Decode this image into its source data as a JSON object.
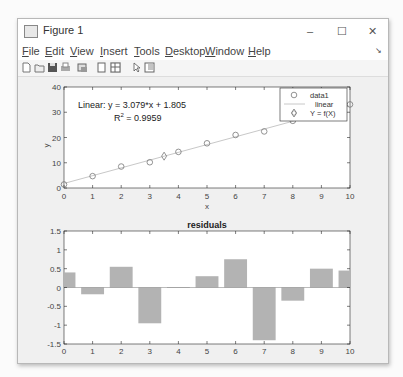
{
  "window": {
    "title": "Figure 1",
    "controls": {
      "minimize": "–",
      "maximize": "☐",
      "close": "✕"
    }
  },
  "menubar": {
    "items": [
      {
        "label": "File",
        "accel": "F"
      },
      {
        "label": "Edit",
        "accel": "E"
      },
      {
        "label": "View",
        "accel": "V"
      },
      {
        "label": "Insert",
        "accel": "I"
      },
      {
        "label": "Tools",
        "accel": "T"
      },
      {
        "label": "Desktop",
        "accel": "D"
      },
      {
        "label": "Window",
        "accel": "W"
      },
      {
        "label": "Help",
        "accel": "H"
      }
    ],
    "dock_icon": "↘"
  },
  "toolbar": {
    "icons": [
      "new-figure-icon",
      "open-file-icon",
      "save-icon",
      "print-icon",
      "link-plot-icon",
      "hide-plot-tools-icon",
      "show-plot-tools-icon",
      "edit-plot-icon",
      "property-inspector-icon"
    ]
  },
  "chart_data": [
    {
      "type": "scatter",
      "title": "",
      "xlabel": "x",
      "ylabel": "y",
      "xlim": [
        0,
        10
      ],
      "ylim": [
        0,
        40
      ],
      "xticks": [
        0,
        1,
        2,
        3,
        4,
        5,
        6,
        7,
        8,
        9,
        10
      ],
      "yticks": [
        0,
        10,
        20,
        30,
        40
      ],
      "annotation": {
        "line1": "Linear:  y = 3.079*x + 1.805",
        "r2_label": "R",
        "r2_sup": "2",
        "r2_value": " = 0.9959"
      },
      "series": [
        {
          "name": "data1",
          "marker": "circle",
          "x": [
            0,
            1,
            2,
            3,
            4,
            5,
            6,
            7,
            8,
            9,
            10
          ],
          "y": [
            1.4,
            4.7,
            8.5,
            10.2,
            14.3,
            17.7,
            21.0,
            22.4,
            26.6,
            30.0,
            33.1
          ]
        },
        {
          "name": "linear",
          "style": "line",
          "slope": 3.079,
          "intercept": 1.805
        },
        {
          "name": "Y = f(X)",
          "marker": "diamond",
          "x": [
            3.5
          ],
          "y": [
            12.6
          ]
        }
      ],
      "legend": {
        "position": "northeast",
        "entries": [
          "data1",
          "linear",
          "Y = f(X)"
        ]
      },
      "colors": {
        "marker": "#777777",
        "line": "#c8c8c8"
      }
    },
    {
      "type": "bar",
      "title": "residuals",
      "xlim": [
        0,
        10
      ],
      "ylim": [
        -1.5,
        1.5
      ],
      "xticks": [
        0,
        1,
        2,
        3,
        4,
        5,
        6,
        7,
        8,
        9,
        10
      ],
      "yticks": [
        1.5,
        1,
        0.5,
        0,
        -0.5,
        -1,
        -1.5
      ],
      "ytick_labels": [
        "1.5",
        "1",
        "0.5",
        "0",
        "-0.5",
        "-1",
        "-1.5"
      ],
      "categories": [
        0,
        1,
        2,
        3,
        4,
        5,
        6,
        7,
        8,
        9,
        10
      ],
      "values": [
        0.4,
        -0.18,
        0.55,
        -0.95,
        0.01,
        0.3,
        0.75,
        -1.4,
        -0.35,
        0.5,
        0.45
      ],
      "colors": {
        "bar": "#b3b3b3"
      }
    }
  ]
}
